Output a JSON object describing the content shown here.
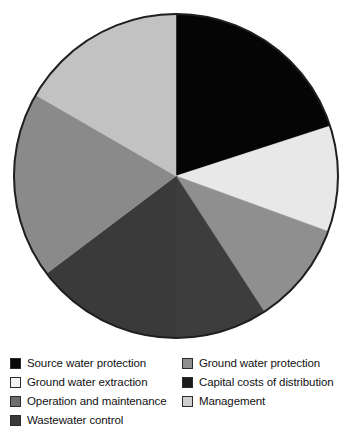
{
  "chart_data": {
    "type": "pie",
    "title": "",
    "subtitle": "",
    "xlabel": "",
    "ylabel": "",
    "grid": false,
    "legend_position": "bottom",
    "center": {
      "cx": 176,
      "cy": 176,
      "r": 162
    },
    "start_angle_deg": 0,
    "direction": "clockwise",
    "categories": [
      "Source water protection",
      "Ground water extraction",
      "Ground water protection",
      "Operation and maintenance",
      "Wastewater control",
      "Capital costs of distribution",
      "Management"
    ],
    "values": [
      20,
      10.5,
      10.3,
      9.2,
      14.7,
      18.6,
      16.7
    ],
    "units": "percent",
    "slices": [
      {
        "label": "Source water protection",
        "value": 20,
        "start_deg": 0,
        "end_deg": 72,
        "color": "#050505"
      },
      {
        "label": "Ground water extraction",
        "value": 10.5,
        "start_deg": 72,
        "end_deg": 110,
        "color": "#e8e8e8"
      },
      {
        "label": "Ground water protection",
        "value": 10.3,
        "start_deg": 110,
        "end_deg": 147,
        "color": "#8f8f8f"
      },
      {
        "label": "Operation and maintenance",
        "value": 9.2,
        "start_deg": 147,
        "end_deg": 180,
        "color": "#3d3d3d"
      },
      {
        "label": "Wastewater control",
        "value": 14.7,
        "start_deg": 180,
        "end_deg": 233,
        "color": "#3a3a3a"
      },
      {
        "label": "Capital costs of distribution",
        "value": 18.6,
        "start_deg": 233,
        "end_deg": 300,
        "color": "#8a8a8a"
      },
      {
        "label": "Management",
        "value": 16.7,
        "start_deg": 300,
        "end_deg": 360,
        "color": "#c2c2c2"
      }
    ],
    "outline_color": "#1f1f1f"
  },
  "legend": {
    "items": [
      {
        "label": "Source water protection",
        "color": "#0a0a0a"
      },
      {
        "label": "Ground water protection",
        "color": "#8f8f8f"
      },
      {
        "label": "Ground water extraction",
        "color": "#f2f2f2"
      },
      {
        "label": "Capital costs of distribution",
        "color": "#1b1b1b"
      },
      {
        "label": "Operation and maintenance",
        "color": "#6e6e6e"
      },
      {
        "label": "Management",
        "color": "#cfcfcf"
      },
      {
        "label": "Wastewater control",
        "color": "#3a3a3a"
      },
      {
        "label": "",
        "color": "#ffffff"
      }
    ]
  }
}
